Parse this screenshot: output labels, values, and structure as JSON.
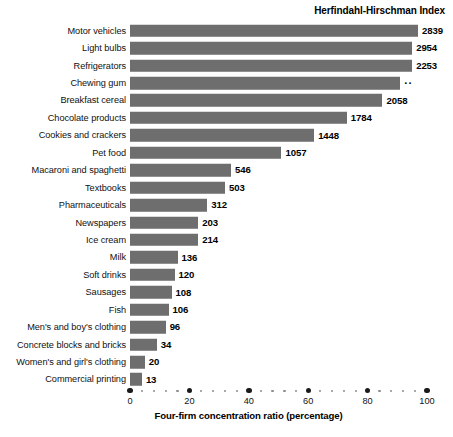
{
  "header": {
    "hhi_title": "Herfindahl-Hirschman Index"
  },
  "axis": {
    "xlabel": "Four-firm concentration ratio (percentage)",
    "ticks": [
      0,
      20,
      40,
      60,
      80,
      100
    ],
    "tick_labels": [
      "0",
      "20",
      "40",
      "60",
      "80",
      "100"
    ],
    "xmin": 0,
    "xmax": 100
  },
  "style": {
    "bar_color": "#6e6e6e",
    "text_color": "#000000",
    "background": "#ffffff"
  },
  "chart_data": {
    "type": "bar",
    "orientation": "horizontal",
    "title": "",
    "xlabel": "Four-firm concentration ratio (percentage)",
    "ylabel": "",
    "xlim": [
      0,
      100
    ],
    "grid": false,
    "legend": "none",
    "value_column_header": "Herfindahl-Hirschman Index",
    "categories": [
      "Motor vehicles",
      "Light bulbs",
      "Refrigerators",
      "Chewing gum",
      "Breakfast cereal",
      "Chocolate products",
      "Cookies and crackers",
      "Pet food",
      "Macaroni and spaghetti",
      "Textbooks",
      "Pharmaceuticals",
      "Newspapers",
      "Ice cream",
      "Milk",
      "Soft drinks",
      "Sausages",
      "Fish",
      "Men's and boy's clothing",
      "Concrete blocks and bricks",
      "Women's and girl's clothing",
      "Commercial printing"
    ],
    "series": [
      {
        "name": "Four-firm concentration ratio (percentage)",
        "values": [
          97,
          95,
          95,
          91,
          85,
          73,
          62,
          51,
          34,
          32,
          26,
          23,
          23,
          16,
          15,
          14,
          13,
          12,
          9,
          5,
          4
        ]
      }
    ],
    "value_labels": [
      "2839",
      "2954",
      "2253",
      "··",
      "2058",
      "1784",
      "1448",
      "1057",
      "546",
      "503",
      "312",
      "203",
      "214",
      "136",
      "120",
      "108",
      "106",
      "96",
      "34",
      "20",
      "13"
    ],
    "rows": [
      {
        "label": "Motor vehicles",
        "ratio": 97,
        "hhi": "2839"
      },
      {
        "label": "Light bulbs",
        "ratio": 95,
        "hhi": "2954"
      },
      {
        "label": "Refrigerators",
        "ratio": 95,
        "hhi": "2253"
      },
      {
        "label": "Chewing gum",
        "ratio": 91,
        "hhi": "··"
      },
      {
        "label": "Breakfast cereal",
        "ratio": 85,
        "hhi": "2058"
      },
      {
        "label": "Chocolate products",
        "ratio": 73,
        "hhi": "1784"
      },
      {
        "label": "Cookies and crackers",
        "ratio": 62,
        "hhi": "1448"
      },
      {
        "label": "Pet food",
        "ratio": 51,
        "hhi": "1057"
      },
      {
        "label": "Macaroni and spaghetti",
        "ratio": 34,
        "hhi": "546"
      },
      {
        "label": "Textbooks",
        "ratio": 32,
        "hhi": "503"
      },
      {
        "label": "Pharmaceuticals",
        "ratio": 26,
        "hhi": "312"
      },
      {
        "label": "Newspapers",
        "ratio": 23,
        "hhi": "203"
      },
      {
        "label": "Ice cream",
        "ratio": 23,
        "hhi": "214"
      },
      {
        "label": "Milk",
        "ratio": 16,
        "hhi": "136"
      },
      {
        "label": "Soft drinks",
        "ratio": 15,
        "hhi": "120"
      },
      {
        "label": "Sausages",
        "ratio": 14,
        "hhi": "108"
      },
      {
        "label": "Fish",
        "ratio": 13,
        "hhi": "106"
      },
      {
        "label": "Men's and boy's clothing",
        "ratio": 12,
        "hhi": "96"
      },
      {
        "label": "Concrete blocks and bricks",
        "ratio": 9,
        "hhi": "34"
      },
      {
        "label": "Women's and girl's clothing",
        "ratio": 5,
        "hhi": "20"
      },
      {
        "label": "Commercial printing",
        "ratio": 4,
        "hhi": "13"
      }
    ]
  }
}
